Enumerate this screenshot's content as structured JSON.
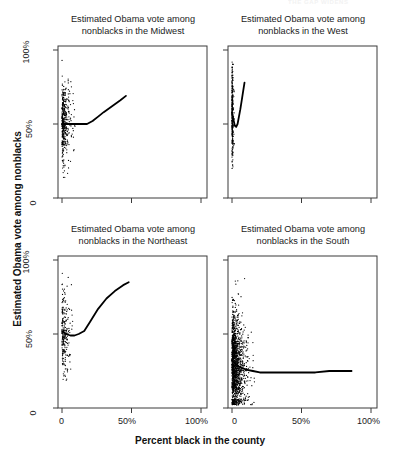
{
  "figure": {
    "faint_header": "THE GAP WIDENS",
    "axis_titles": {
      "y": "Estimated Obama vote among nonblacks",
      "x": "Percent black in the county"
    },
    "y_ticks": [
      "100%",
      "50%",
      "0"
    ],
    "x_ticks": [
      "0",
      "50%",
      "100%"
    ]
  },
  "chart_data": {
    "type": "scatter",
    "title": "",
    "xlabel": "Percent black in the county",
    "ylabel": "Estimated Obama vote among nonblacks",
    "xlim": [
      0,
      100
    ],
    "ylim": [
      0,
      100
    ],
    "grid": false,
    "legend": "none",
    "layout": "2x2 panel grid",
    "panels": [
      {
        "id": "midwest",
        "title": "Estimated Obama vote among nonblacks in the Midwest",
        "title_line1": "Estimated Obama vote among",
        "title_line2": "nonblacks in the Midwest",
        "row": 0,
        "col": 0,
        "n_points": 420,
        "x_range_observed": [
          0,
          46
        ],
        "y_range_observed": [
          12,
          95
        ],
        "point_density": "dense vertical cluster at x<5, sparse tail to x=46",
        "trend_line": {
          "type": "loess",
          "x": [
            0,
            3,
            6,
            10,
            14,
            18,
            22,
            26,
            30,
            36,
            42,
            46
          ],
          "y": [
            50,
            50,
            50,
            50,
            50,
            50,
            52,
            55,
            58,
            62,
            66,
            69
          ]
        }
      },
      {
        "id": "west",
        "title": "Estimated Obama vote among nonblacks in the West",
        "title_line1": "Estimated Obama vote among",
        "title_line2": "nonblacks in the West",
        "row": 0,
        "col": 1,
        "n_points": 290,
        "x_range_observed": [
          0,
          12
        ],
        "y_range_observed": [
          15,
          92
        ],
        "point_density": "very tight cluster at x<4",
        "trend_line": {
          "type": "loess",
          "x": [
            0,
            1,
            2,
            3,
            4,
            5,
            6,
            7,
            8,
            9
          ],
          "y": [
            58,
            53,
            49,
            48,
            50,
            55,
            60,
            66,
            72,
            78
          ]
        }
      },
      {
        "id": "northeast",
        "title": "Estimated Obama vote among nonblacks in the Northeast",
        "title_line1": "Estimated Obama vote among",
        "title_line2": "nonblacks in the Northeast",
        "row": 1,
        "col": 0,
        "n_points": 230,
        "x_range_observed": [
          0,
          48
        ],
        "y_range_observed": [
          18,
          92
        ],
        "point_density": "dense cluster at x<6 with scattered tail",
        "trend_line": {
          "type": "loess",
          "x": [
            0,
            3,
            6,
            9,
            12,
            16,
            20,
            26,
            32,
            38,
            44,
            48
          ],
          "y": [
            52,
            50,
            49,
            49,
            50,
            52,
            58,
            67,
            74,
            79,
            83,
            85
          ]
        }
      },
      {
        "id": "south",
        "title": "Estimated Obama vote among nonblacks in the South",
        "title_line1": "Estimated Obama vote among",
        "title_line2": "nonblacks in the South",
        "row": 1,
        "col": 1,
        "n_points": 1400,
        "x_range_observed": [
          0,
          86
        ],
        "y_range_observed": [
          2,
          88
        ],
        "point_density": "very dense cluster at x<20 spreading broadly to x=86",
        "trend_line": {
          "type": "loess",
          "x": [
            0,
            5,
            10,
            15,
            20,
            30,
            40,
            50,
            60,
            70,
            80,
            86
          ],
          "y": [
            32,
            28,
            26,
            25,
            24,
            24,
            24,
            24,
            24,
            25,
            25,
            25
          ]
        }
      }
    ]
  }
}
